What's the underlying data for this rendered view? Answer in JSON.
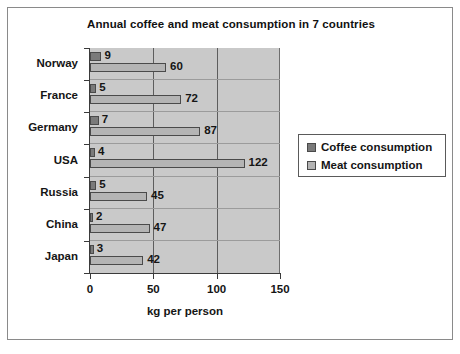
{
  "chart_data": {
    "type": "bar",
    "orientation": "horizontal",
    "title": "Annual coffee and meat consumption in 7 countries",
    "xlabel": "kg per person",
    "ylabel": "",
    "xlim": [
      0,
      150
    ],
    "xticks": [
      0,
      50,
      100,
      150
    ],
    "xtick_labels": [
      "0",
      "50",
      "100",
      "150"
    ],
    "grid": true,
    "grid_axis": "x",
    "legend_position": "right",
    "categories": [
      "Norway",
      "France",
      "Germany",
      "USA",
      "Russia",
      "China",
      "Japan"
    ],
    "series": [
      {
        "name": "Coffee consumption",
        "color": "#7a7a7a",
        "values": [
          9,
          5,
          7,
          4,
          5,
          2,
          3
        ],
        "labels": [
          "9",
          "5",
          "7",
          "4",
          "5",
          "2",
          "3"
        ]
      },
      {
        "name": "Meat consumption",
        "color": "#b4b4b4",
        "values": [
          60,
          72,
          87,
          122,
          45,
          47,
          42
        ],
        "labels": [
          "60",
          "72",
          "87",
          "122",
          "45",
          "47",
          "42"
        ]
      }
    ],
    "plot_background": "#c9c9c9",
    "frame_border": "#8a8a8a"
  },
  "legend": {
    "entries": [
      {
        "label": "Coffee consumption"
      },
      {
        "label": "Meat consumption"
      }
    ]
  }
}
